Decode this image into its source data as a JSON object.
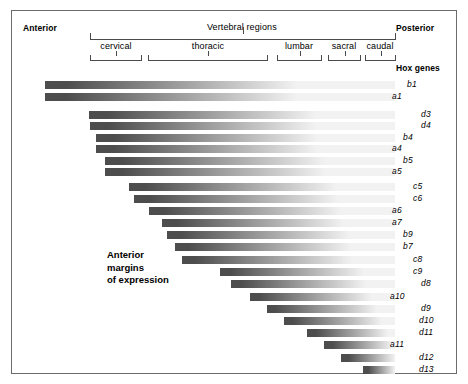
{
  "figure": {
    "axis_labels": {
      "anterior": "Anterior",
      "posterior": "Posterior"
    },
    "vertebral_regions_title": "Vertebral regions",
    "hox_genes_title": "Hox genes",
    "annotation": "Anterior\nmargins\nof expression",
    "regions": [
      {
        "name": "cervical",
        "bracket_x": 78,
        "bracket_w": 52,
        "label_cx": 104
      },
      {
        "name": "thoracic",
        "bracket_x": 136,
        "bracket_w": 120,
        "label_cx": 196
      },
      {
        "name": "lumbar",
        "bracket_x": 265,
        "bracket_w": 45,
        "label_cx": 287
      },
      {
        "name": "sacral",
        "bracket_x": 316,
        "bracket_w": 33,
        "label_cx": 332
      },
      {
        "name": "caudal",
        "bracket_x": 353,
        "bracket_w": 31,
        "label_cx": 368
      }
    ],
    "main_bracket": {
      "x": 78,
      "w": 306,
      "label_cx": 231
    }
  },
  "chart_data": {
    "type": "bar",
    "xlabel": "Vertebral regions (anterior → posterior)",
    "ylabel": "Hox genes",
    "grid": false,
    "legend": "none",
    "bar_right_edge": 383,
    "axis_left": 33,
    "categories": [
      "cervical",
      "thoracic",
      "lumbar",
      "sacral",
      "caudal"
    ],
    "note": "Each bar spans from that gene's anterior expression margin to the posterior end; shading fades posteriorly.",
    "bars": [
      {
        "gene": "b1",
        "label_x": 407,
        "y": 70,
        "start_x": 33,
        "fade_from": 6,
        "fade_to": 72
      },
      {
        "gene": "a1",
        "label_x": 392,
        "y": 82,
        "start_x": 33,
        "fade_from": 6,
        "fade_to": 72
      },
      {
        "gene": "d3",
        "label_x": 421,
        "y": 100,
        "start_x": 77,
        "fade_from": 6,
        "fade_to": 74
      },
      {
        "gene": "d4",
        "label_x": 421,
        "y": 111,
        "start_x": 78,
        "fade_from": 6,
        "fade_to": 74
      },
      {
        "gene": "b4",
        "label_x": 403,
        "y": 123,
        "start_x": 84,
        "fade_from": 6,
        "fade_to": 74
      },
      {
        "gene": "a4",
        "label_x": 392,
        "y": 134,
        "start_x": 84,
        "fade_from": 6,
        "fade_to": 74
      },
      {
        "gene": "b5",
        "label_x": 403,
        "y": 146,
        "start_x": 93,
        "fade_from": 6,
        "fade_to": 76
      },
      {
        "gene": "a5",
        "label_x": 392,
        "y": 157,
        "start_x": 93,
        "fade_from": 6,
        "fade_to": 76
      },
      {
        "gene": "c5",
        "label_x": 413,
        "y": 172,
        "start_x": 117,
        "fade_from": 6,
        "fade_to": 78
      },
      {
        "gene": "c6",
        "label_x": 413,
        "y": 184,
        "start_x": 122,
        "fade_from": 6,
        "fade_to": 78
      },
      {
        "gene": "a6",
        "label_x": 392,
        "y": 196,
        "start_x": 137,
        "fade_from": 6,
        "fade_to": 78
      },
      {
        "gene": "a7",
        "label_x": 392,
        "y": 208,
        "start_x": 150,
        "fade_from": 6,
        "fade_to": 78
      },
      {
        "gene": "b9",
        "label_x": 403,
        "y": 220,
        "start_x": 155,
        "fade_from": 6,
        "fade_to": 80
      },
      {
        "gene": "b7",
        "label_x": 403,
        "y": 232,
        "start_x": 163,
        "fade_from": 6,
        "fade_to": 80
      },
      {
        "gene": "c8",
        "label_x": 413,
        "y": 245,
        "start_x": 170,
        "fade_from": 6,
        "fade_to": 80
      },
      {
        "gene": "c9",
        "label_x": 413,
        "y": 257,
        "start_x": 208,
        "fade_from": 6,
        "fade_to": 82
      },
      {
        "gene": "d8",
        "label_x": 421,
        "y": 269,
        "start_x": 219,
        "fade_from": 6,
        "fade_to": 82
      },
      {
        "gene": "a10",
        "label_x": 390,
        "y": 282,
        "start_x": 238,
        "fade_from": 6,
        "fade_to": 84
      },
      {
        "gene": "d9",
        "label_x": 421,
        "y": 294,
        "start_x": 255,
        "fade_from": 6,
        "fade_to": 86
      },
      {
        "gene": "d10",
        "label_x": 419,
        "y": 306,
        "start_x": 272,
        "fade_from": 8,
        "fade_to": 88
      },
      {
        "gene": "d11",
        "label_x": 419,
        "y": 318,
        "start_x": 295,
        "fade_from": 10,
        "fade_to": 92
      },
      {
        "gene": "a11",
        "label_x": 390,
        "y": 330,
        "start_x": 312,
        "fade_from": 12,
        "fade_to": 96
      },
      {
        "gene": "d12",
        "label_x": 419,
        "y": 343,
        "start_x": 329,
        "fade_from": 14,
        "fade_to": 100
      },
      {
        "gene": "d13",
        "label_x": 419,
        "y": 355,
        "start_x": 351,
        "fade_from": 16,
        "fade_to": 100
      }
    ]
  },
  "colors": {
    "bar_dark": "#4d4d4d",
    "bar_light": "#f2f2f2",
    "frame": "#6b6b6b",
    "bracket": "#4a4a4a",
    "text": "#000000",
    "background": "#ffffff"
  }
}
